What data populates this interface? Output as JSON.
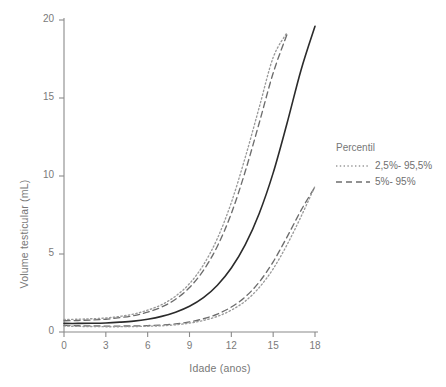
{
  "chart_data": {
    "type": "line",
    "title": "",
    "xlabel": "Idade (anos)",
    "ylabel": "Volume testicular (mL)",
    "xlim": [
      0,
      18
    ],
    "ylim": [
      0,
      20
    ],
    "xticks": [
      "0",
      "3",
      "6",
      "9",
      "12",
      "15",
      "18"
    ],
    "xtick_values": [
      0,
      3,
      6,
      9,
      12,
      15,
      18
    ],
    "yticks": [
      "0",
      "5",
      "10",
      "15",
      "20"
    ],
    "ytick_values": [
      0,
      5,
      10,
      15,
      20
    ],
    "grid": false,
    "legend_position": "right",
    "x": [
      0,
      1,
      2,
      3,
      4,
      5,
      6,
      7,
      8,
      9,
      10,
      11,
      12,
      13,
      14,
      15,
      16,
      17,
      18
    ],
    "series": [
      {
        "name": "97,5%",
        "style": "dotted",
        "color": "#9a9a9a",
        "values": [
          0.8,
          0.82,
          0.85,
          0.9,
          1.0,
          1.15,
          1.4,
          1.75,
          2.3,
          3.1,
          4.3,
          6.0,
          8.3,
          11.2,
          14.4,
          17.6,
          19.2,
          null,
          null
        ]
      },
      {
        "name": "95%",
        "style": "dashed",
        "color": "#6d6d6d",
        "values": [
          0.72,
          0.74,
          0.77,
          0.82,
          0.92,
          1.05,
          1.27,
          1.6,
          2.1,
          2.85,
          3.95,
          5.5,
          7.6,
          10.3,
          13.4,
          16.6,
          19.1,
          null,
          null
        ]
      },
      {
        "name": "Mediana",
        "style": "solid",
        "color": "#2b2b2b",
        "values": [
          0.55,
          0.55,
          0.56,
          0.58,
          0.63,
          0.7,
          0.82,
          1.0,
          1.27,
          1.65,
          2.2,
          3.0,
          4.1,
          5.6,
          7.6,
          10.2,
          13.4,
          16.8,
          19.6
        ]
      },
      {
        "name": "5%",
        "style": "dashed",
        "color": "#6d6d6d",
        "values": [
          0.42,
          0.4,
          0.39,
          0.38,
          0.38,
          0.39,
          0.41,
          0.45,
          0.52,
          0.65,
          0.85,
          1.15,
          1.6,
          2.25,
          3.2,
          4.5,
          6.1,
          7.8,
          9.3
        ]
      },
      {
        "name": "2,5%",
        "style": "dotted",
        "color": "#9a9a9a",
        "values": [
          0.38,
          0.36,
          0.35,
          0.34,
          0.34,
          0.35,
          0.37,
          0.4,
          0.46,
          0.57,
          0.74,
          1.0,
          1.4,
          1.98,
          2.85,
          4.05,
          5.6,
          7.4,
          9.35
        ]
      }
    ],
    "legend": {
      "title": "Percentil",
      "entries": [
        {
          "label": "2,5%- 95,5%",
          "style": "dotted",
          "color": "#9a9a9a"
        },
        {
          "label": "5%- 95%",
          "style": "dashed",
          "color": "#6d6d6d"
        }
      ]
    },
    "colors": {
      "axis": "#8a8a8a",
      "text": "#6f6f6f",
      "dotted_series": "#9a9a9a",
      "dashed_series": "#6d6d6d",
      "median_series": "#2b2b2b",
      "background": "#ffffff"
    }
  }
}
